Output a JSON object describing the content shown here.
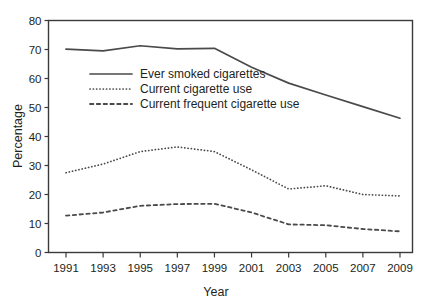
{
  "chart_data": {
    "type": "line",
    "title": "",
    "xlabel": "Year",
    "ylabel": "Percentage",
    "xlim": [
      1991,
      2009
    ],
    "ylim": [
      0,
      80
    ],
    "grid": false,
    "legend_position": "upper-left-inside",
    "x": [
      1991,
      1993,
      1995,
      1997,
      1999,
      2001,
      2003,
      2005,
      2007,
      2009
    ],
    "categories": [
      "1991",
      "1993",
      "1995",
      "1997",
      "1999",
      "2001",
      "2003",
      "2005",
      "2007",
      "2009"
    ],
    "yticks": [
      0,
      10,
      20,
      30,
      40,
      50,
      60,
      70,
      80
    ],
    "ytick_labels": [
      "0",
      "10",
      "20",
      "30",
      "40",
      "50",
      "60",
      "70",
      "80"
    ],
    "series": [
      {
        "name": "Ever smoked cigarettes",
        "style": "solid",
        "values": [
          70.1,
          69.5,
          71.3,
          70.2,
          70.4,
          63.9,
          58.4,
          54.3,
          50.3,
          46.3
        ]
      },
      {
        "name": "Current cigarette use",
        "style": "dotted",
        "values": [
          27.5,
          30.5,
          34.8,
          36.4,
          34.8,
          28.5,
          21.9,
          23.0,
          20.0,
          19.5
        ]
      },
      {
        "name": "Current frequent cigarette use",
        "style": "dashed",
        "values": [
          12.7,
          13.8,
          16.1,
          16.7,
          16.8,
          13.8,
          9.7,
          9.4,
          8.1,
          7.3
        ]
      }
    ]
  },
  "legend": {
    "items": [
      {
        "label": "Ever smoked cigarettes",
        "style": "solid"
      },
      {
        "label": "Current cigarette use",
        "style": "dotted"
      },
      {
        "label": "Current frequent cigarette use",
        "style": "dashed"
      }
    ]
  },
  "axes": {
    "y_title": "Percentage",
    "x_title": "Year"
  },
  "colors": {
    "line": "#4a4a4a",
    "frame": "#3a3a3a",
    "text": "#231f20",
    "background": "#ffffff"
  }
}
